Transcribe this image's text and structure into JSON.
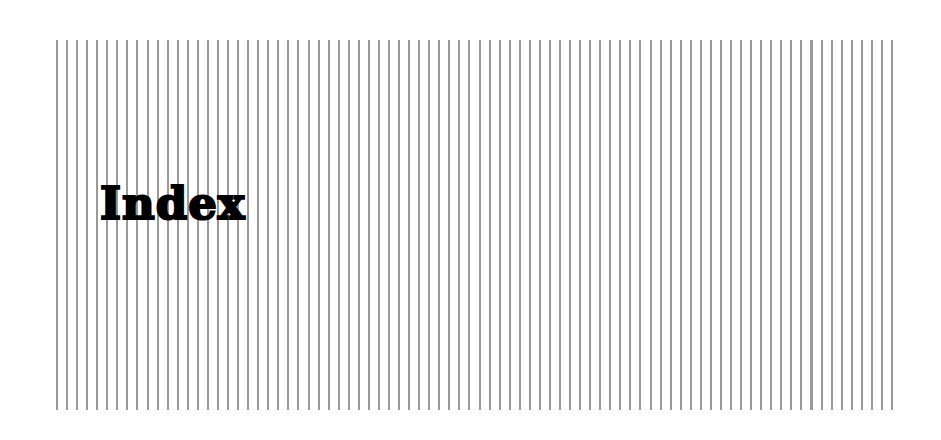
{
  "page": {
    "title": "Index"
  },
  "colors": {
    "stripe": "#9a9a9a",
    "background": "#ffffff",
    "text": "#000000"
  }
}
